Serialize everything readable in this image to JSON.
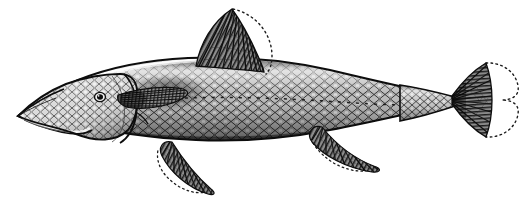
{
  "figure": {
    "kind": "scientific-illustration",
    "view": "lateral left-facing",
    "technique": "engraving / stipple-and-line halftone",
    "background_color": "#ffffff",
    "ink_color": "#1a1a1a",
    "midtone_color": "#6e6e6e",
    "highlight_color": "#f2f2f2",
    "canvas": {
      "width": 529,
      "height": 201
    }
  },
  "anatomy": {
    "snout": {
      "label": "snout",
      "x": 18,
      "y": 116
    },
    "mouth": {
      "label": "mouth",
      "x": 40,
      "y": 124
    },
    "eye": {
      "label": "eye",
      "x": 100,
      "y": 97,
      "radius": 4,
      "color": "#141414"
    },
    "head": {
      "label": "head",
      "x": 60,
      "y": 105
    },
    "operculum": {
      "label": "gill cover",
      "x": 112,
      "y": 104
    },
    "body": {
      "label": "body",
      "x": 250,
      "y": 100
    },
    "lateral_line": {
      "label": "lateral line",
      "y": 100
    },
    "caudal_peduncle": {
      "label": "caudal peduncle",
      "x": 420,
      "y": 100
    }
  },
  "fins": [
    {
      "name": "dorsal-fin",
      "label": "Dorsal fin",
      "position": "mid-back",
      "ray_count": 12,
      "has_dotted_outline": true,
      "origin_x": 196,
      "origin_y": 66,
      "apex_x": 234,
      "apex_y": 8
    },
    {
      "name": "pectoral-fin",
      "label": "Pectoral fin",
      "position": "behind gill cover",
      "ray_count": 11,
      "has_dotted_outline": false,
      "origin_x": 118,
      "origin_y": 96,
      "apex_x": 180,
      "apex_y": 90
    },
    {
      "name": "pelvic-fin",
      "label": "Pelvic fin",
      "position": "ventral mid-body",
      "ray_count": 12,
      "has_dotted_outline": true,
      "origin_x": 172,
      "origin_y": 143,
      "apex_x": 215,
      "apex_y": 192
    },
    {
      "name": "anal-fin",
      "label": "Anal fin",
      "position": "ventral posterior",
      "ray_count": 11,
      "has_dotted_outline": true,
      "origin_x": 322,
      "origin_y": 128,
      "apex_x": 385,
      "apex_y": 168
    },
    {
      "name": "caudal-fin",
      "label": "Caudal fin",
      "position": "tail",
      "ray_count": 14,
      "has_dotted_outline": true,
      "shape": "forked",
      "origin_x": 452,
      "origin_y": 100,
      "apex_x": 516,
      "apex_y": 100
    }
  ],
  "scales": {
    "pattern": "diamond lattice",
    "rows": 15,
    "columns": 46,
    "visible_region": "head to caudal peduncle"
  },
  "annotations": {
    "dotted_outline_meaning": "membrane extent of fin",
    "caption": ""
  }
}
